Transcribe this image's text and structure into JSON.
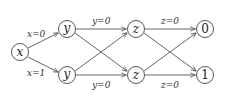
{
  "nodes": {
    "x": "x",
    "y_top": "y",
    "y_bottom": "y",
    "z_top": "z",
    "z_bottom": "z",
    "out_0": "0",
    "out_1": "1"
  },
  "edges": {
    "x_to_y_top": "x=0",
    "x_to_y_bottom": "x=1",
    "y_top_to_z_top": "y=0",
    "y_bottom_to_z_bottom": "y=0",
    "z_top_to_out_0": "z=0",
    "z_bottom_to_out_1": "z=0"
  },
  "colors": {
    "stroke": "#444444",
    "text": "#222222"
  }
}
